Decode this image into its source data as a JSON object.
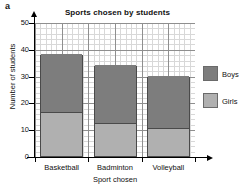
{
  "question_label": "a",
  "legend": {
    "position": "right",
    "entries": [
      {
        "label": "Boys",
        "color": "#7d7d7d",
        "swatch_name": "legend-swatch-boys"
      },
      {
        "label": "Girls",
        "color": "#b0b0b0",
        "swatch_name": "legend-swatch-girls"
      }
    ]
  },
  "chart_data": {
    "type": "bar",
    "subtype": "stacked",
    "title": "Sports chosen by students",
    "xlabel": "Sport chosen",
    "ylabel": "Number of students",
    "categories": [
      "Basketball",
      "Badminton",
      "Volleyball"
    ],
    "series": [
      {
        "name": "Girls",
        "color": "#b0b0b0",
        "values": [
          16,
          12,
          10
        ]
      },
      {
        "name": "Boys",
        "color": "#7d7d7d",
        "values": [
          22,
          22,
          20
        ]
      }
    ],
    "totals": [
      38,
      34,
      30
    ],
    "ylim": [
      0,
      50
    ],
    "ytick_labels": [
      "0",
      "10",
      "20",
      "30",
      "40",
      "50"
    ],
    "ytick_values": [
      0,
      10,
      20,
      30,
      40,
      50
    ],
    "y_major_step": 10,
    "y_minor_step": 2,
    "grid": true,
    "grid_minor": true,
    "legend_position": "right"
  }
}
